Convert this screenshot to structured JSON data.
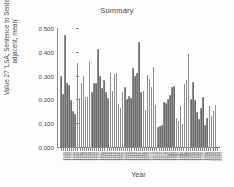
{
  "chart_data": {
    "type": "bar",
    "title": "Summary",
    "xlabel": "Year",
    "ylabel": "Value 27 'LSA, Sentence to Sentence, adjacent, mean'",
    "ylim": [
      0.0,
      0.5
    ],
    "yticks": [
      "0.000",
      "0.100",
      "0.200",
      "0.300",
      "0.400",
      "0.500"
    ],
    "ytick_values": [
      0.0,
      0.1,
      0.2,
      0.3,
      0.4,
      0.5
    ],
    "grid": false,
    "legend": "none",
    "bar_color": "#6e6e6e",
    "categories": [
      "1930",
      "1931",
      "1932",
      "1933",
      "1934",
      "1935",
      "1936",
      "1937",
      "1938",
      "1939",
      "1940",
      "1941",
      "1942",
      "1943",
      "1944",
      "1945",
      "1946",
      "1947",
      "1948",
      "1949",
      "1950",
      "1951",
      "1952",
      "1953",
      "1954",
      "1955",
      "1956",
      "1957",
      "1958",
      "1959",
      "1960",
      "1961",
      "1962",
      "1963",
      "1964",
      "1965",
      "1966",
      "1967",
      "1968",
      "1969",
      "1970",
      "1971",
      "1972",
      "1973",
      "1974",
      "1975",
      "1976",
      "1977",
      "1978",
      "1979",
      "1980",
      "1981",
      "1982",
      "1983",
      "1984",
      "1985",
      "1986",
      "1987",
      "1988",
      "1989",
      "1990",
      "1991",
      "1992",
      "1993",
      "1994",
      "1995",
      "1996",
      "1997",
      "1998",
      "1999",
      "2000",
      "2001",
      "2002",
      "2003",
      "2004",
      "2005"
    ],
    "values": [
      0.297,
      0.224,
      0.472,
      0.268,
      0.262,
      0.197,
      0.15,
      0.137,
      0.355,
      0.206,
      0.271,
      0.3,
      0.211,
      0.21,
      0.36,
      0.233,
      0.271,
      0.267,
      0.41,
      0.299,
      0.247,
      0.283,
      0.23,
      0.206,
      0.312,
      0.235,
      0.305,
      0.312,
      0.182,
      0.164,
      0.232,
      0.251,
      0.203,
      0.213,
      0.206,
      0.332,
      0.297,
      0.313,
      0.44,
      0.232,
      0.235,
      0.157,
      0.302,
      0.287,
      0.253,
      0.338,
      0.176,
      0.082,
      0.088,
      0.092,
      0.19,
      0.184,
      0.2,
      0.219,
      0.252,
      0.256,
      0.122,
      0.11,
      0.172,
      0.098,
      0.265,
      0.28,
      0.392,
      0.203,
      0.275,
      0.196,
      0.148,
      0.118,
      0.165,
      0.211,
      0.093,
      0.122,
      0.174,
      0.131,
      0.15,
      0.176
    ]
  }
}
